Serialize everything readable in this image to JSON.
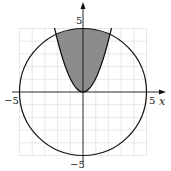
{
  "diagram": {
    "title": "",
    "axes": {
      "x_label": "x",
      "x_min_label": "−5",
      "x_max_label": "5",
      "y_max_label": "5",
      "y_min_label": "−5"
    },
    "curves": [
      {
        "name": "circle",
        "equation": "x^2 + y^2 = 25"
      },
      {
        "name": "parabola",
        "equation": "y = x^2"
      }
    ],
    "shaded_region": "between parabola y = x^2 and upper circle",
    "colors": {
      "grid": "#d9d9d9",
      "curve": "#111111",
      "shade": "#8c8c8c",
      "background": "#ffffff"
    }
  }
}
